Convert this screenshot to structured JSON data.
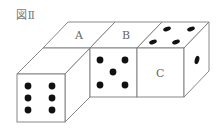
{
  "figure": {
    "title": "図Ⅱ",
    "labels": {
      "a": "A",
      "b": "B",
      "c": "C"
    },
    "dice": [
      {
        "name": "left-die",
        "front_pips": 6,
        "top_face_label": "A"
      },
      {
        "name": "middle-die",
        "front_pips": 5,
        "top_face_label": "B"
      },
      {
        "name": "right-die",
        "front_face_label": "C",
        "top_pips": 4,
        "right_pips": 1
      }
    ],
    "colors": {
      "line": "#7a7a7a",
      "pip": "#111111",
      "label": "#666666"
    }
  }
}
